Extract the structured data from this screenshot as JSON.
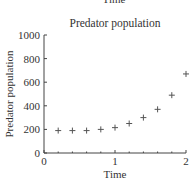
{
  "clipped_label": "Time",
  "chart_data": {
    "type": "scatter",
    "title": "Predator population",
    "xlabel": "Time",
    "ylabel": "Predator population",
    "xlim": [
      0,
      2
    ],
    "ylim": [
      0,
      1000
    ],
    "xticks": [
      "0",
      "1",
      "2"
    ],
    "yticks": [
      "0",
      "200",
      "400",
      "600",
      "800",
      "1000"
    ],
    "grid": false,
    "marker": "+",
    "series": [
      {
        "name": "Predator population",
        "x": [
          0.2,
          0.4,
          0.6,
          0.8,
          1.0,
          1.2,
          1.4,
          1.6,
          1.8,
          2.0
        ],
        "y": [
          190,
          190,
          190,
          200,
          215,
          250,
          300,
          370,
          490,
          670
        ]
      }
    ]
  }
}
